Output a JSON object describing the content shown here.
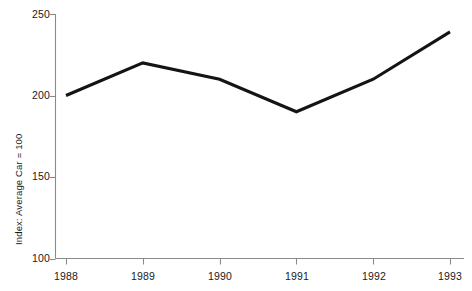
{
  "chart_data": {
    "type": "line",
    "title": "",
    "subtitle": "",
    "xlabel": "",
    "ylabel": "Index: Average Car = 100",
    "categories": [
      "1988",
      "1989",
      "1990",
      "1991",
      "1992",
      "1993"
    ],
    "x": [
      1988,
      1989,
      1990,
      1991,
      1992,
      1993
    ],
    "values": [
      200,
      220,
      210,
      190,
      210,
      239
    ],
    "series": [
      {
        "name": "Index",
        "values": [
          200,
          220,
          210,
          190,
          210,
          239
        ]
      }
    ],
    "ylim": [
      100,
      250
    ],
    "yticks": [
      100,
      150,
      200,
      250
    ],
    "ytick_labels": [
      "100",
      "150",
      "200",
      "250"
    ],
    "xtick_labels": [
      "1988",
      "1989",
      "1990",
      "1991",
      "1992",
      "1993"
    ],
    "grid": false,
    "legend": false,
    "legend_position": "none",
    "annotations": [],
    "line_color": "#141414",
    "axis_color": "#8a8a8a",
    "background_color": "#ffffff"
  },
  "axes": {
    "y_axis_title": "Index: Average Car = 100"
  }
}
